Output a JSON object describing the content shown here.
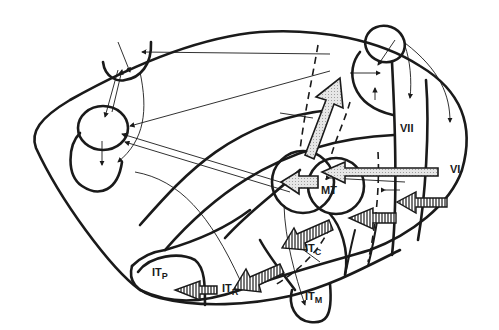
{
  "diagram": {
    "labels": {
      "vi": "VI",
      "vii": "VII",
      "mt": "MT",
      "it_p": {
        "main": "IT",
        "sub": "P"
      },
      "it_r": {
        "main": "IT",
        "sub": "R"
      },
      "it_c": {
        "main": "IT",
        "sub": "C"
      },
      "it_m": {
        "main": "IT",
        "sub": "M"
      }
    },
    "colors": {
      "stroke": "#1a1a1a",
      "background": "#ffffff",
      "arrow_fill": "#d8d8d8"
    }
  }
}
